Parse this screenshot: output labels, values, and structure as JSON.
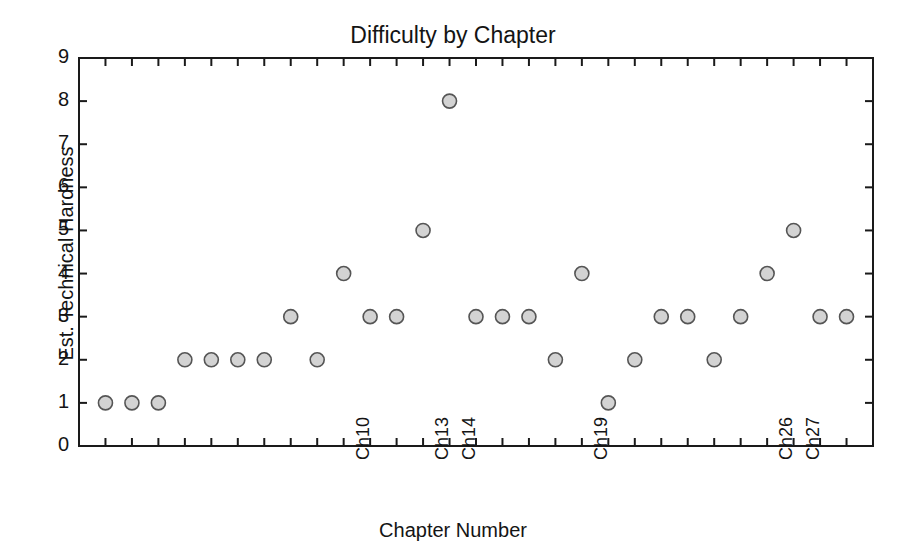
{
  "chart_data": {
    "type": "scatter",
    "title": "Difficulty by Chapter",
    "xlabel": "Chapter Number",
    "ylabel": "Est. Technical Hardness",
    "xlim": [
      0,
      30
    ],
    "ylim": [
      0,
      9
    ],
    "grid": false,
    "legend": null,
    "ytick_labels": [
      "0",
      "1",
      "2",
      "3",
      "4",
      "5",
      "6",
      "7",
      "8",
      "9"
    ],
    "ytick_values": [
      0,
      1,
      2,
      3,
      4,
      5,
      6,
      7,
      8,
      9
    ],
    "xtick_labels_visible": [
      "Ch10",
      "Ch13",
      "Ch14",
      "Ch19",
      "Ch26",
      "Ch27"
    ],
    "xtick_label_values": [
      10,
      13,
      14,
      19,
      26,
      27
    ],
    "categories": [
      "Ch1",
      "Ch2",
      "Ch3",
      "Ch4",
      "Ch5",
      "Ch6",
      "Ch7",
      "Ch8",
      "Ch9",
      "Ch10",
      "Ch11",
      "Ch12",
      "Ch13",
      "Ch14",
      "Ch15",
      "Ch16",
      "Ch17",
      "Ch18",
      "Ch19",
      "Ch20",
      "Ch21",
      "Ch22",
      "Ch23",
      "Ch24",
      "Ch25",
      "Ch26",
      "Ch27",
      "Ch28",
      "Ch29"
    ],
    "x": [
      1,
      2,
      3,
      4,
      5,
      6,
      7,
      8,
      9,
      10,
      11,
      12,
      13,
      14,
      15,
      16,
      17,
      18,
      19,
      20,
      21,
      22,
      23,
      24,
      25,
      26,
      27,
      28,
      29
    ],
    "values": [
      1,
      1,
      1,
      2,
      2,
      2,
      2,
      3,
      2,
      4,
      3,
      3,
      5,
      8,
      3,
      3,
      3,
      2,
      4,
      1,
      2,
      3,
      3,
      2,
      3,
      4,
      5,
      3,
      3
    ],
    "marker": {
      "shape": "circle",
      "face_color": "#d3d3d3",
      "edge_color": "#555555",
      "radius": 7
    },
    "axes": {
      "frame_color": "#1a1a1a",
      "background": "#ffffff",
      "spines": [
        "left",
        "bottom",
        "top",
        "right"
      ]
    }
  }
}
